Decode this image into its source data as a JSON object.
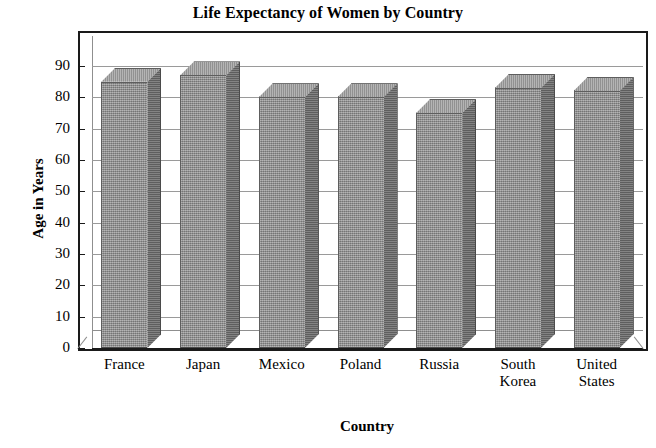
{
  "chart_data": {
    "type": "bar",
    "title": "Life Expectancy of Women by Country",
    "xlabel": "Country",
    "ylabel": "Age in Years",
    "categories": [
      "France",
      "Japan",
      "Mexico",
      "Poland",
      "Russia",
      "South Korea",
      "United States"
    ],
    "category_lines": [
      [
        "France"
      ],
      [
        "Japan"
      ],
      [
        "Mexico"
      ],
      [
        "Poland"
      ],
      [
        "Russia"
      ],
      [
        "South",
        "Korea"
      ],
      [
        "United",
        "States"
      ]
    ],
    "values": [
      85,
      87,
      80,
      80,
      75,
      83,
      82
    ],
    "ylim": [
      0,
      90
    ],
    "ytick_values": [
      0,
      10,
      20,
      30,
      40,
      50,
      60,
      70,
      80,
      90
    ],
    "ytick_labels": [
      "0",
      "10",
      "20",
      "30",
      "40",
      "50",
      "60",
      "70",
      "80",
      "90"
    ],
    "ytick_step": 10,
    "grid": true,
    "grid_axis": "y",
    "legend": false,
    "style": "3d-columns",
    "bar_color": "#8d8d8d",
    "bar_side_color": "#6b6b6b",
    "bar_top_color": "#9d9d9d",
    "gridline_color": "#9a9a9a",
    "frame_color": "#1a1a1a",
    "background_color": "#ffffff"
  }
}
